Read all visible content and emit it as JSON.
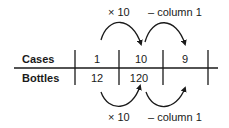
{
  "table": {
    "rows": [
      {
        "label": "Cases",
        "values": [
          "1",
          "10",
          "9"
        ]
      },
      {
        "label": "Bottles",
        "values": [
          "12",
          "120",
          ""
        ]
      }
    ]
  },
  "top_annotations": {
    "op1": "× 10",
    "op2": "– column 1"
  },
  "bottom_annotations": {
    "op1": "× 10",
    "op2": "– column 1"
  },
  "colors": {
    "ink": "#1a1a1a",
    "background": "#ffffff"
  }
}
